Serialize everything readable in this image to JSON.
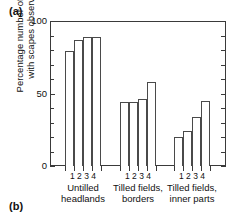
{
  "panels": {
    "a_label": "(a)",
    "b_label": "(b)"
  },
  "chart_data": {
    "type": "bar",
    "title": "",
    "xlabel": "",
    "ylabel": "Percentage number of fields with scapes observed",
    "ylabel_line1": "Percentage number of fields",
    "ylabel_line2": "with scapes observed",
    "ylim": [
      0,
      100
    ],
    "yticks": [
      0,
      50,
      100
    ],
    "ytick_labels": [
      "0",
      "50",
      "100"
    ],
    "y_minor_tick_step": 10,
    "grid": false,
    "legend": "none",
    "bar_labels": [
      "1",
      "2",
      "3",
      "4"
    ],
    "groups": [
      {
        "name": "Untilled headlands",
        "caption_line1": "Untilled",
        "caption_line2": "headlands",
        "categories": [
          "1",
          "2",
          "3",
          "4"
        ],
        "values": [
          79,
          87,
          89,
          89
        ]
      },
      {
        "name": "Tilled fields, borders",
        "caption_line1": "Tilled fields,",
        "caption_line2": "borders",
        "categories": [
          "1",
          "2",
          "3",
          "4"
        ],
        "values": [
          44,
          44,
          46,
          58
        ]
      },
      {
        "name": "Tilled fields, inner parts",
        "caption_line1": "Tilled fields,",
        "caption_line2": "inner parts",
        "categories": [
          "1",
          "2",
          "3",
          "4"
        ],
        "values": [
          20,
          24,
          34,
          45
        ]
      }
    ],
    "colors": {
      "bar_fill": "#ffffff",
      "bar_stroke": "#4a4a4a",
      "axis": "#3a3a3a",
      "text": "#111111",
      "background": "#ffffff"
    }
  }
}
